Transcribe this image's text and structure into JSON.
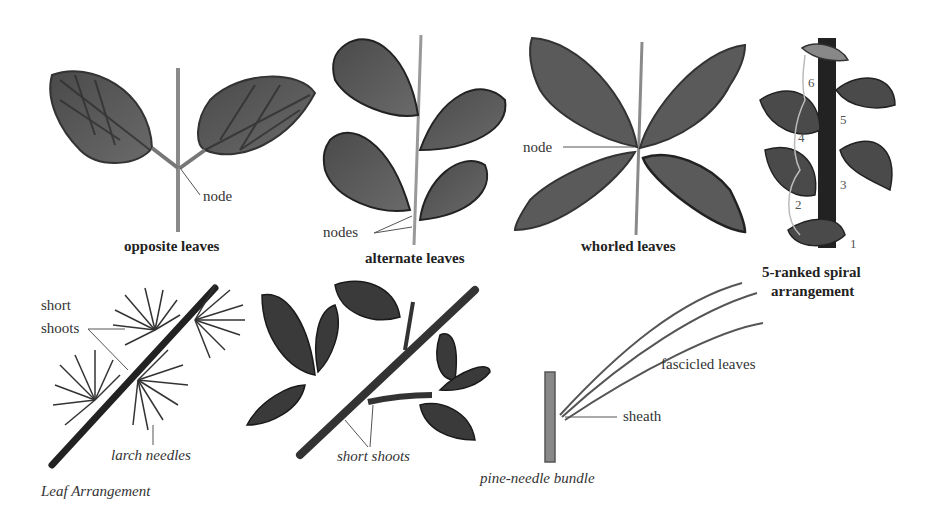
{
  "figure": {
    "title": "Leaf Arrangement"
  },
  "panels": {
    "opposite": {
      "caption": "opposite leaves",
      "labels": {
        "node": "node"
      }
    },
    "alternate": {
      "caption": "alternate leaves",
      "labels": {
        "nodes": "nodes"
      }
    },
    "whorled": {
      "caption": "whorled leaves",
      "labels": {
        "node": "node"
      }
    },
    "spiral": {
      "caption_line1": "5-ranked spiral",
      "caption_line2": "arrangement",
      "numbers": [
        "1",
        "2",
        "3",
        "4",
        "5",
        "6"
      ]
    },
    "larch": {
      "labels": {
        "short_shoots_1": "short",
        "short_shoots_2": "shoots",
        "needles": "larch needles"
      }
    },
    "shortshoot_branch": {
      "labels": {
        "short_shoots": "short shoots"
      }
    },
    "pine": {
      "caption": "pine-needle bundle",
      "labels": {
        "fascicled": "fascicled leaves",
        "sheath": "sheath"
      }
    }
  },
  "colors": {
    "leaf_dark": "#3a3a3a",
    "leaf_mid": "#6b6b6b",
    "stem": "#8a8a8a",
    "line": "#555555"
  }
}
